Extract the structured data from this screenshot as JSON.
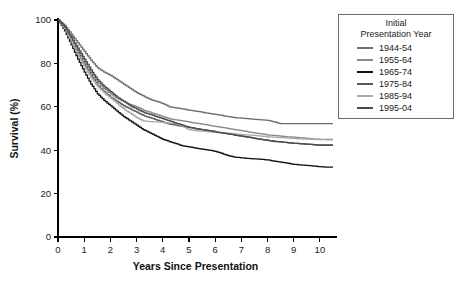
{
  "chart_data": {
    "type": "line",
    "title": "",
    "xlabel": "Years Since Presentation",
    "ylabel": "Survival (%)",
    "xlim": [
      0,
      10.5
    ],
    "ylim": [
      0,
      100
    ],
    "xticks": [
      "0",
      "1",
      "2",
      "3",
      "4",
      "5",
      "6",
      "7",
      "8",
      "9",
      "10"
    ],
    "xtick_values": [
      0,
      1,
      2,
      3,
      4,
      5,
      6,
      7,
      8,
      9,
      10
    ],
    "yticks": [
      "0",
      "20",
      "40",
      "60",
      "80",
      "100"
    ],
    "ytick_values": [
      0,
      20,
      40,
      60,
      80,
      100
    ],
    "grid": false,
    "legend_position": "right-top",
    "legend_title": "Initial Presentation Year",
    "legend_title_lines": [
      "Initial",
      "Presentation Year"
    ],
    "x": [
      0,
      0.25,
      0.5,
      0.75,
      1,
      1.25,
      1.5,
      1.75,
      2,
      2.25,
      2.5,
      2.75,
      3,
      3.25,
      3.5,
      3.75,
      4,
      4.25,
      4.5,
      4.75,
      5,
      5.25,
      5.5,
      5.75,
      6,
      6.25,
      6.5,
      6.75,
      7,
      7.25,
      7.5,
      7.75,
      8,
      8.25,
      8.5,
      8.75,
      9,
      9.25,
      9.5,
      9.75,
      10,
      10.25,
      10.5
    ],
    "series": [
      {
        "name": "1944-54",
        "color": "#6e6e6e",
        "values": [
          100,
          97.5,
          93.5,
          89.5,
          85.5,
          81.5,
          78.0,
          76.0,
          74.5,
          72.5,
          70.5,
          68.5,
          66.5,
          65.0,
          63.5,
          62.5,
          61.5,
          60.0,
          59.5,
          59.0,
          58.5,
          58.0,
          57.5,
          57.0,
          56.5,
          56.0,
          55.5,
          55.0,
          54.8,
          54.5,
          54.2,
          54.0,
          53.8,
          53.0,
          52.2,
          52.2,
          52.2,
          52.2,
          52.2,
          52.2,
          52.2,
          52.2,
          52.2
        ]
      },
      {
        "name": "1955-64",
        "color": "#8a8a8a",
        "values": [
          100,
          96.5,
          91.5,
          86.5,
          81.0,
          76.0,
          71.5,
          68.5,
          66.0,
          64.0,
          62.5,
          61.0,
          60.0,
          58.5,
          57.5,
          56.5,
          55.5,
          54.5,
          54.0,
          53.5,
          53.0,
          52.5,
          52.0,
          51.5,
          51.0,
          50.5,
          50.0,
          49.5,
          49.0,
          48.5,
          48.0,
          47.5,
          47.0,
          46.8,
          46.5,
          46.2,
          46.0,
          45.8,
          45.5,
          45.2,
          45.0,
          45.0,
          45.0
        ]
      },
      {
        "name": "1965-74",
        "color": "#121212",
        "values": [
          100,
          95.0,
          88.5,
          82.0,
          76.0,
          70.5,
          66.0,
          63.0,
          60.5,
          58.0,
          55.5,
          53.5,
          51.5,
          49.5,
          48.0,
          46.5,
          45.0,
          44.0,
          43.0,
          42.0,
          41.5,
          41.0,
          40.5,
          40.0,
          39.5,
          38.5,
          37.5,
          36.8,
          36.5,
          36.2,
          36.0,
          35.8,
          35.5,
          35.0,
          34.5,
          34.0,
          33.5,
          33.2,
          33.0,
          32.7,
          32.4,
          32.2,
          32.2
        ]
      },
      {
        "name": "1975-84",
        "color": "#5a5a5a",
        "values": [
          100,
          96.0,
          90.5,
          85.0,
          79.5,
          74.5,
          70.0,
          67.0,
          64.5,
          62.5,
          60.5,
          59.0,
          57.5,
          56.0,
          55.0,
          54.0,
          53.0,
          52.0,
          51.5,
          51.0,
          50.5,
          50.0,
          49.5,
          49.0,
          48.5,
          48.0,
          47.5,
          47.0,
          46.5,
          46.0,
          45.5,
          45.0,
          44.5,
          44.0,
          43.8,
          43.5,
          43.2,
          43.0,
          42.8,
          42.5,
          42.2,
          42.2,
          42.2
        ]
      },
      {
        "name": "1985-94",
        "color": "#a8a8a8",
        "values": [
          100,
          96.0,
          90.0,
          84.0,
          78.5,
          73.5,
          69.5,
          66.5,
          64.0,
          61.5,
          59.0,
          57.0,
          55.0,
          53.5,
          53.2,
          53.0,
          52.8,
          52.5,
          52.2,
          51.0,
          49.5,
          49.0,
          48.8,
          48.5,
          48.2,
          48.0,
          47.8,
          47.5,
          47.2,
          47.0,
          46.8,
          46.5,
          46.2,
          46.0,
          45.8,
          45.6,
          45.4,
          45.2,
          45.1,
          45.0,
          44.9,
          44.8,
          44.8
        ]
      },
      {
        "name": "1995-04",
        "color": "#4a4a4a",
        "values": [
          100,
          96.8,
          92.0,
          87.0,
          82.0,
          77.0,
          72.5,
          69.5,
          67.0,
          64.5,
          62.5,
          60.5,
          59.0,
          57.5,
          56.5,
          55.5,
          54.5,
          53.5,
          52.5,
          51.5,
          50.5,
          50.0,
          49.5,
          49.0,
          48.5,
          48.0,
          47.5,
          47.0,
          46.5,
          46.0,
          45.5,
          45.0,
          44.5,
          44.2,
          43.8,
          43.5,
          43.2,
          43.0,
          42.8,
          42.6,
          42.4,
          42.4,
          42.4
        ]
      }
    ]
  },
  "legend": {
    "title_line1": "Initial",
    "title_line2": "Presentation Year",
    "items": [
      {
        "label": "1944-54",
        "color": "#6e6e6e"
      },
      {
        "label": "1955-64",
        "color": "#8a8a8a"
      },
      {
        "label": "1965-74",
        "color": "#121212"
      },
      {
        "label": "1975-84",
        "color": "#5a5a5a"
      },
      {
        "label": "1985-94",
        "color": "#a8a8a8"
      },
      {
        "label": "1995-04",
        "color": "#4a4a4a"
      }
    ]
  }
}
